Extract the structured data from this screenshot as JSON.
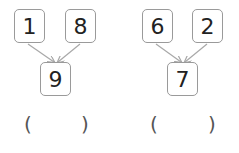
{
  "groups": [
    {
      "addends": [
        "1",
        "8"
      ],
      "sum": "9",
      "answer_open": "(",
      "answer_close": ")"
    },
    {
      "addends": [
        "6",
        "2"
      ],
      "sum": "7",
      "answer_open": "(",
      "answer_close": ")"
    }
  ],
  "colors": {
    "border": "#9a9a9a",
    "arrow": "#a8a8a8",
    "text": "#222222"
  }
}
